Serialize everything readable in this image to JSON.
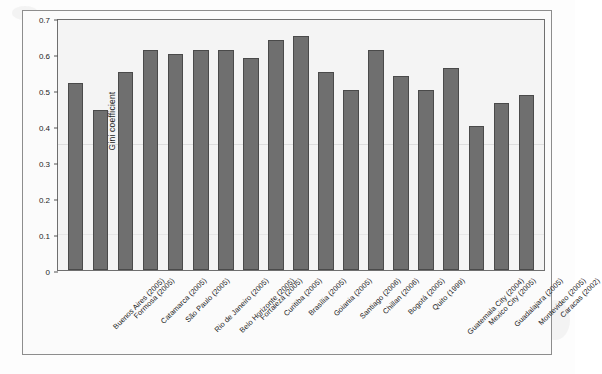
{
  "chart_data": {
    "type": "bar",
    "title": "",
    "subtitle": "",
    "xlabel": "",
    "ylabel": "Gini coefficient",
    "ylim": [
      0,
      0.7
    ],
    "yticks": [
      "0",
      "0.1",
      "0.2",
      "0.3",
      "0.4",
      "0.5",
      "0.6",
      "0.7"
    ],
    "ytick_values": [
      0,
      0.1,
      0.2,
      0.3,
      0.4,
      0.5,
      0.6,
      0.7
    ],
    "grid": false,
    "legend": null,
    "legend_position": "none",
    "bar_color": "#6f6f6f",
    "bar_edge_color": "#4a4a4a",
    "categories": [
      "Buenos Aires (2005)",
      "Formosa (2005)",
      "Catamarca (2005)",
      "São Paulo (2005)",
      "Rio de Janeiro (2005)",
      "Belo Horizonte (2005)",
      "Fortaleza (2005)",
      "Curitiba (2005)",
      "Brasília (2005)",
      "Goiania (2005)",
      "Santiago (2006)",
      "Chillan (2006)",
      "Bogotá (2005)",
      "Quito (1999)",
      "Guatemala City (2004)",
      "Mexico City (2005)",
      "Guadalajara (2005)",
      "Montevideo (2005)",
      "Caracas (2002)"
    ],
    "values": [
      0.52,
      0.445,
      0.55,
      0.61,
      0.6,
      0.61,
      0.61,
      0.59,
      0.64,
      0.65,
      0.55,
      0.5,
      0.61,
      0.54,
      0.5,
      0.56,
      0.4,
      0.465,
      0.485
    ]
  }
}
